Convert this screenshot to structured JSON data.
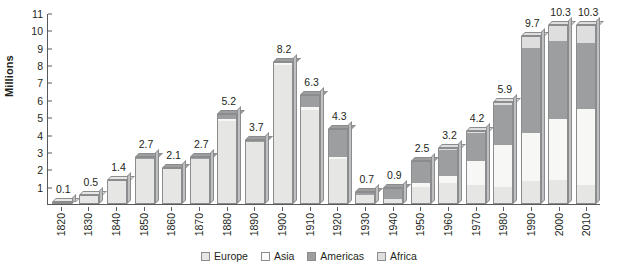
{
  "chart_data": {
    "type": "bar",
    "stacked": true,
    "title": "",
    "subtitle": "",
    "xlabel": "",
    "ylabel": "Millions",
    "ylim": [
      0,
      11
    ],
    "ytick_labels": [
      "1",
      "2",
      "3",
      "4",
      "5",
      "6",
      "7",
      "8",
      "9",
      "10",
      "11"
    ],
    "grid": false,
    "legend_position": "bottom",
    "categories": [
      "1820",
      "1830",
      "1840",
      "1850",
      "1860",
      "1870",
      "1880",
      "1890",
      "1900",
      "1910",
      "1920",
      "1930",
      "1940",
      "1950",
      "1960",
      "1970",
      "1980",
      "1990",
      "2000",
      "2010"
    ],
    "totals": [
      0.1,
      0.5,
      1.4,
      2.7,
      2.1,
      2.7,
      5.2,
      3.7,
      8.2,
      6.3,
      4.3,
      0.7,
      0.9,
      2.5,
      3.2,
      4.2,
      5.9,
      9.7,
      10.3,
      10.3
    ],
    "total_labels": [
      "0.1",
      "0.5",
      "1.4",
      "2.7",
      "2.1",
      "2.7",
      "5.2",
      "3.7",
      "8.2",
      "6.3",
      "4.3",
      "0.7",
      "0.9",
      "2.5",
      "3.2",
      "4.2",
      "5.9",
      "9.7",
      "10.3",
      "10.3"
    ],
    "series": [
      {
        "name": "Europe",
        "color": "#e6e6e5",
        "values": [
          0.1,
          0.5,
          1.4,
          2.6,
          2.0,
          2.6,
          4.8,
          3.6,
          8.0,
          5.4,
          2.6,
          0.5,
          0.3,
          1.0,
          1.2,
          1.1,
          1.0,
          1.3,
          1.4,
          1.1
        ]
      },
      {
        "name": "Asia",
        "color": "#f7f7f6",
        "values": [
          0.0,
          0.0,
          0.0,
          0.0,
          0.0,
          0.0,
          0.1,
          0.0,
          0.1,
          0.2,
          0.1,
          0.0,
          0.0,
          0.2,
          0.4,
          1.4,
          2.4,
          2.8,
          3.5,
          4.4
        ]
      },
      {
        "name": "Americas",
        "color": "#9d9e9f",
        "values": [
          0.0,
          0.0,
          0.0,
          0.1,
          0.1,
          0.1,
          0.3,
          0.1,
          0.1,
          0.7,
          1.6,
          0.2,
          0.6,
          1.3,
          1.5,
          1.6,
          2.3,
          4.9,
          4.5,
          3.8
        ]
      },
      {
        "name": "Africa",
        "color": "#dedede",
        "values": [
          0.0,
          0.0,
          0.0,
          0.0,
          0.0,
          0.0,
          0.0,
          0.0,
          0.0,
          0.0,
          0.0,
          0.0,
          0.0,
          0.0,
          0.1,
          0.1,
          0.2,
          0.7,
          0.9,
          1.0
        ]
      }
    ]
  },
  "legend": {
    "items": [
      {
        "label": "Europe",
        "swatch": "europe-swatch"
      },
      {
        "label": "Asia",
        "swatch": "asia-swatch"
      },
      {
        "label": "Americas",
        "swatch": "americas-swatch"
      },
      {
        "label": "Africa",
        "swatch": "africa-swatch"
      }
    ]
  }
}
